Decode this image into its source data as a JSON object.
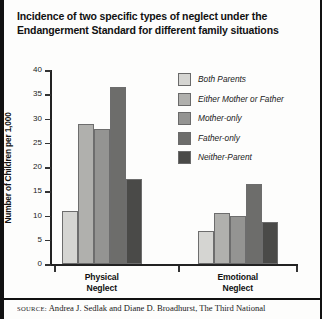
{
  "figure": {
    "title": "Incidence of two specific types of neglect under the Endangerment Standard for different family situations",
    "source_prefix": "SOURCE:",
    "source_text": "Andrea J. Sedlak and Diane D. Broadhurst, The Third National"
  },
  "chart_data": {
    "type": "bar",
    "title": "Incidence of two specific types of neglect under the Endangerment Standard for different family situations",
    "xlabel": "",
    "ylabel": "Number of Children per 1,000",
    "categories": [
      "Physical\nNeglect",
      "Emotional\nNeglect"
    ],
    "ylim": [
      0,
      40
    ],
    "yticks": [
      0,
      5,
      10,
      15,
      20,
      25,
      30,
      35,
      40
    ],
    "ytick_labels": [
      "0",
      "5",
      "10",
      "15",
      "20",
      "25",
      "30",
      "35",
      "40"
    ],
    "grid": false,
    "legend_position": "upper right",
    "series": [
      {
        "name": "Both Parents",
        "values": [
          11.0,
          6.8
        ],
        "color": "#d5d5d2"
      },
      {
        "name": "Either Mother or Father",
        "values": [
          28.8,
          10.6
        ],
        "color": "#b0b0ad"
      },
      {
        "name": "Mother-only",
        "values": [
          27.8,
          9.8
        ],
        "color": "#949492"
      },
      {
        "name": "Father-only",
        "values": [
          36.6,
          16.4
        ],
        "color": "#6d6d6b"
      },
      {
        "name": "Neither-Parent",
        "values": [
          17.6,
          8.7
        ],
        "color": "#4a4a48"
      }
    ]
  }
}
